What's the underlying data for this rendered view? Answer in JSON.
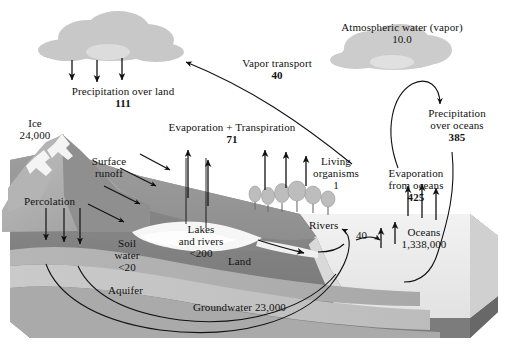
{
  "figure": {
    "type": "process-diagram",
    "units_note": "Pools in thousands of cubic kilometers; fluxes in thousands of cubic kilometers per year",
    "palette": {
      "background": "#ffffff",
      "cloud": "#c9c9c9",
      "cloud_highlight": "#dedede",
      "sky": "#ffffff",
      "mountain_light": "#b9b9b9",
      "mountain_mid": "#a3a3a3",
      "mountain_dark": "#8d8d8d",
      "land_mid": "#9a9a9a",
      "land_dark": "#7e7e7e",
      "soil_band": "#b0b0b0",
      "aquifer": "#c2c2c2",
      "groundwater": "#aeaeae",
      "water_light": "#efefef",
      "ocean_top": "#ededed",
      "block_front": "#8a8a8a",
      "block_side": "#6f6f6f",
      "outline": "#111111",
      "text": "#121212"
    }
  },
  "labels": {
    "atmospheric_water": {
      "name": "Atmospheric water (vapor)",
      "value": "10.0"
    },
    "precipitation_over_land": {
      "name": "Precipitation over land",
      "value": "111"
    },
    "ice": {
      "name": "Ice",
      "value": "24,000"
    },
    "surface_runoff": {
      "name_line1": "Surface",
      "name_line2": "runoff"
    },
    "percolation": {
      "name": "Percolation"
    },
    "evaporation_transpiration": {
      "name": "Evaporation + Transpiration",
      "value": "71"
    },
    "vapor_transport": {
      "name": "Vapor transport",
      "value": "40"
    },
    "living_organisms": {
      "name_line1": "Living",
      "name_line2": "organisms",
      "value": "1"
    },
    "lakes_and_rivers": {
      "name_line1": "Lakes",
      "name_line2": "and rivers",
      "value": "<200"
    },
    "soil_water": {
      "name_line1": "Soil",
      "name_line2": "water",
      "value": "<20"
    },
    "land": {
      "name": "Land"
    },
    "aquifer": {
      "name": "Aquifer"
    },
    "groundwater": {
      "name": "Groundwater",
      "value": "23,000"
    },
    "rivers": {
      "name": "Rivers",
      "value": "40"
    },
    "oceans": {
      "name": "Oceans",
      "value": "1,338,000"
    },
    "evaporation_from_oceans": {
      "name_line1": "Evaporation",
      "name_line2": "from oceans",
      "value": "425"
    },
    "precipitation_over_oceans": {
      "name_line1": "Precipitation",
      "name_line2": "over oceans",
      "value": "385"
    }
  },
  "flows": [
    {
      "id": "precipitation-over-land",
      "label": "Precipitation over land",
      "value": "111",
      "direction": "atmosphere-to-land"
    },
    {
      "id": "evaporation-transpiration",
      "label": "Evaporation + Transpiration",
      "value": "71",
      "direction": "land-to-atmosphere"
    },
    {
      "id": "vapor-transport",
      "label": "Vapor transport",
      "value": "40",
      "direction": "ocean-atmosphere-to-land-atmosphere"
    },
    {
      "id": "precipitation-over-oceans",
      "label": "Precipitation over oceans",
      "value": "385",
      "direction": "atmosphere-to-ocean"
    },
    {
      "id": "evaporation-from-oceans",
      "label": "Evaporation from oceans",
      "value": "425",
      "direction": "ocean-to-atmosphere"
    },
    {
      "id": "rivers-runoff",
      "label": "Rivers",
      "value": "40",
      "direction": "land-to-ocean"
    }
  ],
  "pools": [
    {
      "id": "atmospheric-water",
      "label": "Atmospheric water (vapor)",
      "value": "10.0"
    },
    {
      "id": "ice",
      "label": "Ice",
      "value": "24,000"
    },
    {
      "id": "lakes-and-rivers",
      "label": "Lakes and rivers",
      "value": "<200"
    },
    {
      "id": "soil-water",
      "label": "Soil water",
      "value": "<20"
    },
    {
      "id": "groundwater",
      "label": "Groundwater",
      "value": "23,000"
    },
    {
      "id": "living-organisms",
      "label": "Living organisms",
      "value": "1"
    },
    {
      "id": "oceans",
      "label": "Oceans",
      "value": "1,338,000"
    }
  ]
}
